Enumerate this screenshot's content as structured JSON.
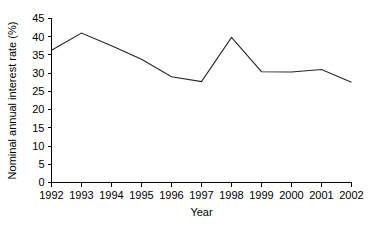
{
  "chart_data": {
    "type": "line",
    "title": "",
    "xlabel": "Year",
    "ylabel": "Nominal annual interest rate (%)",
    "categories": [
      "1992",
      "1993",
      "1994",
      "1995",
      "1996",
      "1997",
      "1998",
      "1999",
      "2000",
      "2001",
      "2002"
    ],
    "values": [
      36.3,
      41.0,
      37.5,
      33.8,
      29.0,
      27.7,
      39.8,
      30.4,
      30.3,
      31.0,
      27.5
    ],
    "series": [
      {
        "name": "Nominal annual interest rate",
        "values": [
          36.3,
          41.0,
          37.5,
          33.8,
          29.0,
          27.7,
          39.8,
          30.4,
          30.3,
          31.0,
          27.5
        ]
      }
    ],
    "ylim": [
      0,
      45
    ],
    "ytick_step": 5,
    "yticks": [
      0,
      5,
      10,
      15,
      20,
      25,
      30,
      35,
      40,
      45
    ],
    "ytick_labels": [
      "0",
      "5",
      "10",
      "15",
      "20",
      "25",
      "30",
      "35",
      "40",
      "45"
    ],
    "xtick_labels": [
      "1992",
      "1993",
      "1994",
      "1995",
      "1996",
      "1997",
      "1998",
      "1999",
      "2000",
      "2001",
      "2002"
    ],
    "grid": false,
    "legend": null,
    "legend_position": "none",
    "annotations": [],
    "line_color": "#262626",
    "axis_color": "#000000",
    "background_color": "#ffffff"
  },
  "labels": {
    "y_axis_title": "Nominal annual interest rate (%)",
    "x_axis_title": "Year"
  }
}
